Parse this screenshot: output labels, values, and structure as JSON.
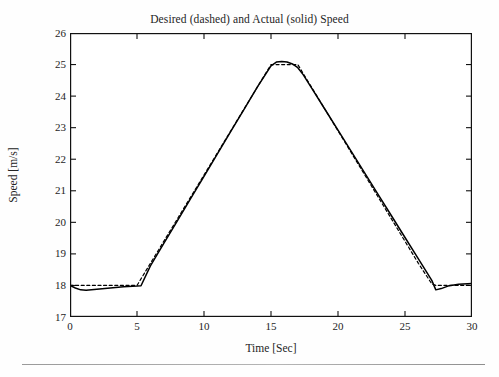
{
  "figure": {
    "title": "Desired (dashed) and Actual (solid) Speed",
    "background_color": "#fefefe",
    "axis_color": "#1a1a1a",
    "series_color": "#000000"
  },
  "axes": {
    "xlabel": "Time [Sec]",
    "ylabel": "Speed [m/s]",
    "xticks": [
      "0",
      "5",
      "10",
      "15",
      "20",
      "25",
      "30"
    ],
    "yticks": [
      "17",
      "18",
      "19",
      "20",
      "21",
      "22",
      "23",
      "24",
      "25",
      "26"
    ]
  },
  "chart_data": {
    "type": "line",
    "title": "Desired (dashed) and Actual (solid) Speed",
    "xlabel": "Time [Sec]",
    "ylabel": "Speed [m/s]",
    "xlim": [
      0,
      30
    ],
    "ylim": [
      17,
      26
    ],
    "xticks": [
      0,
      5,
      10,
      15,
      20,
      25,
      30
    ],
    "yticks": [
      17,
      18,
      19,
      20,
      21,
      22,
      23,
      24,
      25,
      26
    ],
    "grid": false,
    "legend": "none (encoded in title: dashed = Desired, solid = Actual)",
    "series": [
      {
        "name": "Desired",
        "style": "dashed",
        "color": "#000000",
        "x": [
          0,
          1,
          2,
          3,
          4,
          5,
          6,
          7,
          8,
          9,
          10,
          11,
          12,
          13,
          14,
          15,
          15.5,
          16,
          16.5,
          17,
          18,
          19,
          20,
          21,
          22,
          23,
          24,
          25,
          26,
          27,
          27.3,
          28,
          29,
          30
        ],
        "y": [
          18.0,
          18.0,
          18.0,
          18.0,
          18.0,
          18.0,
          18.7,
          19.4,
          20.1,
          20.8,
          21.5,
          22.2,
          22.9,
          23.6,
          24.3,
          25.0,
          25.0,
          25.0,
          25.0,
          25.0,
          24.3,
          23.6,
          22.9,
          22.2,
          21.5,
          20.8,
          20.1,
          19.4,
          18.7,
          18.05,
          18.0,
          18.0,
          18.0,
          18.0
        ]
      },
      {
        "name": "Actual",
        "style": "solid",
        "color": "#000000",
        "x": [
          0,
          0.4,
          0.8,
          1.2,
          2,
          3,
          4,
          5,
          5.3,
          6,
          7,
          8,
          9,
          10,
          11,
          12,
          13,
          14,
          15,
          15.4,
          15.8,
          16.2,
          16.6,
          17,
          17.4,
          18,
          19,
          20,
          21,
          22,
          23,
          24,
          25,
          26,
          27,
          27.3,
          27.7,
          28.2,
          29,
          30
        ],
        "y": [
          18.0,
          17.92,
          17.86,
          17.85,
          17.88,
          17.92,
          17.96,
          17.98,
          17.99,
          18.62,
          19.33,
          20.04,
          20.75,
          21.46,
          22.17,
          22.88,
          23.59,
          24.3,
          24.96,
          25.08,
          25.1,
          25.08,
          25.02,
          24.9,
          24.68,
          24.28,
          23.6,
          22.92,
          22.24,
          21.56,
          20.88,
          20.2,
          19.52,
          18.84,
          18.16,
          17.86,
          17.9,
          17.98,
          18.04,
          18.06
        ]
      }
    ],
    "annotations": [
      {
        "label": "plateau",
        "x_range": [
          15,
          17
        ],
        "y": 25.0
      },
      {
        "label": "initial steady level",
        "x_range": [
          0,
          5
        ],
        "y": 18.0
      },
      {
        "label": "final steady level",
        "x_range": [
          27.5,
          30
        ],
        "y": 18.0
      }
    ]
  }
}
